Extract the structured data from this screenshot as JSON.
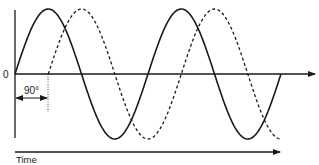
{
  "diagram": {
    "title": "",
    "labels": {
      "zero": "0",
      "phase_shift": "90°",
      "time_axis": "Time"
    },
    "waves": [
      {
        "name": "reference-wave",
        "style": "solid",
        "phase_deg": 0,
        "cycles": 2
      },
      {
        "name": "lagging-wave",
        "style": "dashed",
        "phase_deg": -90,
        "cycles": 1.75
      }
    ],
    "colors": {
      "stroke": "#1a1a1a",
      "background": "#ffffff"
    }
  }
}
